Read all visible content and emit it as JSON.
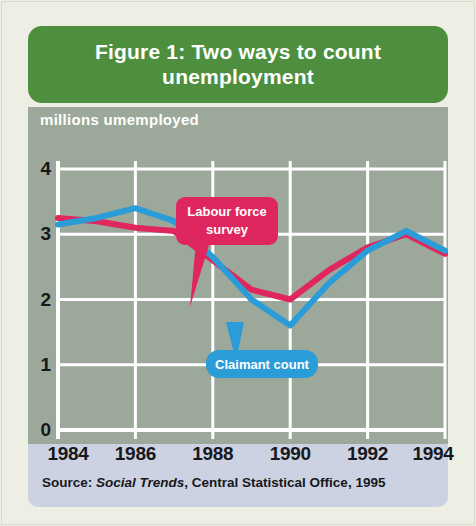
{
  "figure": {
    "title": "Figure 1: Two ways to count unemployment",
    "title_line_1": "Figure 1: Two ways to count",
    "title_line_2": "unemployment",
    "source_prefix": "Source:",
    "source_publication": "Social Trends",
    "source_rest": ", Central Statistical Office, 1995",
    "source_full": "Source: Social Trends, Central Statistical Office, 1995"
  },
  "colors": {
    "title_bar": "#4d8f3e",
    "chart_panel": "#9ca99a",
    "footer_panel": "#ccd2e1",
    "page_background": "#edefe4",
    "gridline": "#ffffff",
    "labour_force_survey": "#e0265e",
    "claimant_count": "#2a9cd8",
    "tick_text": "#17181c",
    "axis_title_text": "#ffffff"
  },
  "annotations": {
    "labour_force_survey_label_line_1": "Labour force",
    "labour_force_survey_label_line_2": "survey",
    "labour_force_survey_label": "Labour force survey",
    "claimant_count_label": "Claimant count"
  },
  "chart_data": {
    "type": "line",
    "title": "Figure 1: Two ways to count unemployment",
    "xlabel": "",
    "ylabel": "millions umemployed",
    "ylim": [
      0,
      4
    ],
    "xlim": [
      1984,
      1994
    ],
    "y_ticks": [
      0,
      1,
      2,
      3,
      4
    ],
    "y_tick_labels": [
      "0",
      "1",
      "2",
      "3",
      "4"
    ],
    "x_ticks": [
      1984,
      1986,
      1988,
      1990,
      1992,
      1994
    ],
    "x_tick_labels": [
      "1984",
      "1986",
      "1988",
      "1990",
      "1992",
      "1994"
    ],
    "x": [
      1984,
      1985,
      1986,
      1987,
      1988,
      1989,
      1990,
      1991,
      1992,
      1993,
      1994
    ],
    "grid": true,
    "legend_position": "inline-callouts",
    "series": [
      {
        "name": "Labour force survey",
        "color": "#e0265e",
        "values": [
          3.25,
          3.2,
          3.1,
          3.05,
          2.6,
          2.15,
          2.0,
          2.45,
          2.8,
          3.0,
          2.7
        ]
      },
      {
        "name": "Claimant count",
        "color": "#2a9cd8",
        "values": [
          3.15,
          3.25,
          3.4,
          3.2,
          2.65,
          2.0,
          1.6,
          2.25,
          2.75,
          3.05,
          2.75
        ]
      }
    ]
  }
}
